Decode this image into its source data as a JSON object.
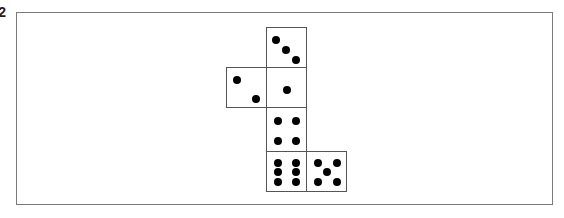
{
  "figure": {
    "label_fragment": "2",
    "colors": {
      "frame_border": "#7a7a7a",
      "cell_border": "#555555",
      "pip": "#000000",
      "background": "#ffffff"
    },
    "faces": [
      {
        "id": "top",
        "pips": 3,
        "x": 266,
        "y": 27,
        "w": 41,
        "h": 41,
        "pip_positions": [
          [
            9,
            12
          ],
          [
            19,
            22
          ],
          [
            29,
            32
          ]
        ]
      },
      {
        "id": "left",
        "pips": 2,
        "x": 226,
        "y": 67,
        "w": 41,
        "h": 41,
        "pip_positions": [
          [
            10,
            12
          ],
          [
            29,
            31
          ]
        ]
      },
      {
        "id": "center",
        "pips": 1,
        "x": 266,
        "y": 67,
        "w": 41,
        "h": 41,
        "pip_positions": [
          [
            20,
            22
          ]
        ]
      },
      {
        "id": "middle-lower",
        "pips": 4,
        "x": 266,
        "y": 107,
        "w": 41,
        "h": 45,
        "pip_positions": [
          [
            11,
            13
          ],
          [
            29,
            13
          ],
          [
            11,
            33
          ],
          [
            29,
            33
          ]
        ]
      },
      {
        "id": "bottom",
        "pips": 6,
        "x": 266,
        "y": 151,
        "w": 41,
        "h": 41,
        "pip_positions": [
          [
            11,
            11
          ],
          [
            29,
            11
          ],
          [
            11,
            20
          ],
          [
            29,
            20
          ],
          [
            11,
            30
          ],
          [
            29,
            30
          ]
        ]
      },
      {
        "id": "bottom-right",
        "pips": 5,
        "x": 306,
        "y": 151,
        "w": 41,
        "h": 41,
        "pip_positions": [
          [
            11,
            11
          ],
          [
            30,
            11
          ],
          [
            20,
            20
          ],
          [
            11,
            30
          ],
          [
            30,
            30
          ]
        ]
      }
    ]
  }
}
